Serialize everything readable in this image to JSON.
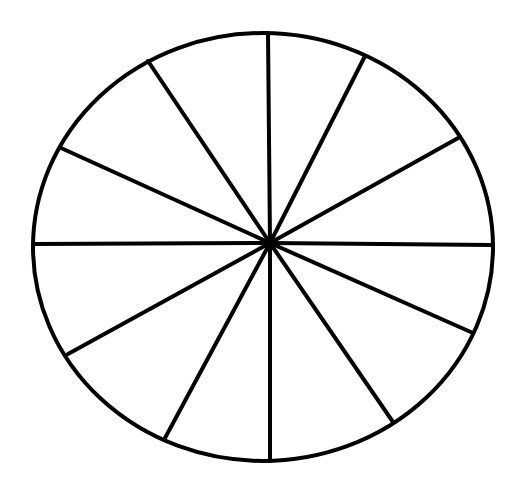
{
  "diagram": {
    "type": "divided-circle",
    "sector_count": 12,
    "stroke_color": "#000000",
    "fill_color": "#ffffff",
    "background": "#ffffff",
    "center": [
      270,
      243
    ],
    "ellipse": {
      "cx": 263,
      "cy": 247,
      "rx": 230,
      "ry": 214
    },
    "stroke_width": 4,
    "spoke_endpoints": [
      [
        268,
        33
      ],
      [
        365,
        56
      ],
      [
        460,
        137
      ],
      [
        493,
        245
      ],
      [
        473,
        333
      ],
      [
        393,
        422
      ],
      [
        270,
        461
      ],
      [
        165,
        438
      ],
      [
        68,
        354
      ],
      [
        33,
        244
      ],
      [
        61,
        148
      ],
      [
        148,
        61
      ]
    ]
  }
}
